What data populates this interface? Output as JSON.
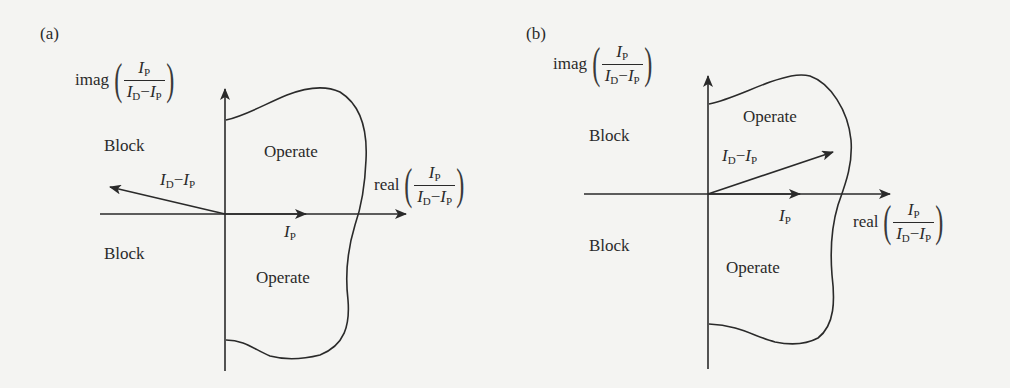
{
  "panels": [
    {
      "id": "a",
      "label": "(a)",
      "imag_axis": {
        "fn": "imag",
        "num_var": "I",
        "num_sub": "P",
        "den_var1": "I",
        "den_sub1": "D",
        "den_op": "−",
        "den_var2": "I",
        "den_sub2": "P"
      },
      "real_axis": {
        "fn": "real",
        "num_var": "I",
        "num_sub": "P",
        "den_var1": "I",
        "den_sub1": "D",
        "den_op": "−",
        "den_var2": "I",
        "den_sub2": "P"
      },
      "regions": {
        "block_top": "Block",
        "block_bottom": "Block",
        "operate_top": "Operate",
        "operate_bottom": "Operate"
      },
      "vectors": {
        "id_minus_ip": {
          "var1": "I",
          "sub1": "D",
          "op": "−",
          "var2": "I",
          "sub2": "P"
        },
        "ip": {
          "var": "I",
          "sub": "P"
        }
      }
    },
    {
      "id": "b",
      "label": "(b)",
      "imag_axis": {
        "fn": "imag",
        "num_var": "I",
        "num_sub": "P",
        "den_var1": "I",
        "den_sub1": "D",
        "den_op": "−",
        "den_var2": "I",
        "den_sub2": "P"
      },
      "real_axis": {
        "fn": "real",
        "num_var": "I",
        "num_sub": "P",
        "den_var1": "I",
        "den_sub1": "D",
        "den_op": "−",
        "den_var2": "I",
        "den_sub2": "P"
      },
      "regions": {
        "block_top": "Block",
        "block_bottom": "Block",
        "operate_top": "Operate",
        "operate_bottom": "Operate"
      },
      "vectors": {
        "id_minus_ip": {
          "var1": "I",
          "sub1": "D",
          "op": "−",
          "var2": "I",
          "sub2": "P"
        },
        "ip": {
          "var": "I",
          "sub": "P"
        }
      }
    }
  ],
  "colors": {
    "ink": "#2a2a2a",
    "paper": "#f4f4f2"
  }
}
